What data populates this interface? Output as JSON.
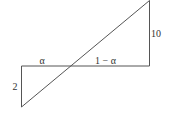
{
  "diagram": {
    "type": "similar-triangles",
    "colors": {
      "line": "#555555",
      "text": "#333333",
      "background": "#ffffff"
    },
    "points": {
      "bottom_left": [
        21.5,
        107
      ],
      "top_left": [
        21.5,
        66
      ],
      "top_right_base": [
        149.5,
        66
      ],
      "apex": [
        149.5,
        0.5
      ]
    },
    "labels": {
      "left_side": "2",
      "right_side": "10",
      "left_segment": "α",
      "right_segment": "1 − α"
    }
  }
}
